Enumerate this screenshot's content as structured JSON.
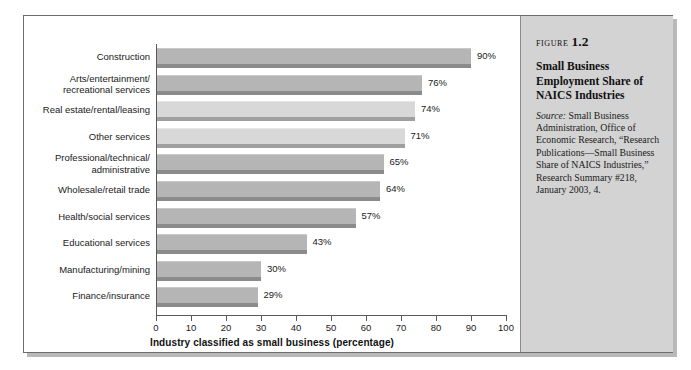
{
  "figure": {
    "label_word": "Figure",
    "number": "1.2",
    "title": "Small Business Employment Share of NAICS Industries",
    "source_word": "Source:",
    "source_text": " Small Business Administration, Office of Economic Research, “Research Publications—Small Business Share of NAICS Industries,” Research Summary #218, January 2003, 4."
  },
  "chart_data": {
    "type": "bar",
    "orientation": "horizontal",
    "title": "Small Business Employment Share of NAICS Industries",
    "xlabel": "Industry classified as small business (percentage)",
    "ylabel": "",
    "xlim": [
      0,
      100
    ],
    "xticks": [
      0,
      10,
      20,
      30,
      40,
      50,
      60,
      70,
      80,
      90,
      100
    ],
    "xtick_labels": [
      "0",
      "10",
      "20",
      "30",
      "40",
      "50",
      "60",
      "70",
      "80",
      "90",
      "100"
    ],
    "grid": false,
    "legend": false,
    "value_suffix": "%",
    "categories": [
      "Construction",
      "Arts/entertainment/ recreational services",
      "Real estate/rental/leasing",
      "Other services",
      "Professional/technical/ administrative",
      "Wholesale/retail trade",
      "Health/social services",
      "Educational services",
      "Manufacturing/mining",
      "Finance/insurance"
    ],
    "values": [
      90,
      76,
      74,
      71,
      65,
      64,
      57,
      43,
      30,
      29
    ],
    "value_labels": [
      "90%",
      "76%",
      "74%",
      "71%",
      "65%",
      "64%",
      "57%",
      "43%",
      "30%",
      "29%"
    ],
    "bars": [
      {
        "category_line1": "Construction",
        "category_line2": "",
        "value": 90,
        "value_label": "90%",
        "shade": "dark"
      },
      {
        "category_line1": "Arts/entertainment/",
        "category_line2": "recreational services",
        "value": 76,
        "value_label": "76%",
        "shade": "dark"
      },
      {
        "category_line1": "Real estate/rental/leasing",
        "category_line2": "",
        "value": 74,
        "value_label": "74%",
        "shade": "light"
      },
      {
        "category_line1": "Other services",
        "category_line2": "",
        "value": 71,
        "value_label": "71%",
        "shade": "light"
      },
      {
        "category_line1": "Professional/technical/",
        "category_line2": "administrative",
        "value": 65,
        "value_label": "65%",
        "shade": "dark"
      },
      {
        "category_line1": "Wholesale/retail trade",
        "category_line2": "",
        "value": 64,
        "value_label": "64%",
        "shade": "dark"
      },
      {
        "category_line1": "Health/social services",
        "category_line2": "",
        "value": 57,
        "value_label": "57%",
        "shade": "dark"
      },
      {
        "category_line1": "Educational services",
        "category_line2": "",
        "value": 43,
        "value_label": "43%",
        "shade": "dark"
      },
      {
        "category_line1": "Manufacturing/mining",
        "category_line2": "",
        "value": 30,
        "value_label": "30%",
        "shade": "dark"
      },
      {
        "category_line1": "Finance/insurance",
        "category_line2": "",
        "value": 29,
        "value_label": "29%",
        "shade": "dark"
      }
    ]
  },
  "colors": {
    "bar_dark": "#b5b5b5",
    "bar_light": "#d8d8d8",
    "bar_shadow": "#8b8b8b",
    "axis": "#595959",
    "caption_panel": "#d3d3d3",
    "frame_border": "#6d6d6d",
    "text": "#1a1a1a"
  }
}
